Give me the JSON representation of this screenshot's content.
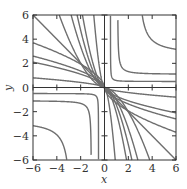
{
  "chart_data": {
    "type": "line",
    "title": "",
    "xlabel": "x",
    "ylabel": "y",
    "xlim": [
      -6,
      6
    ],
    "ylim": [
      -6,
      6
    ],
    "xticks": [
      -6,
      -4,
      -2,
      0,
      2,
      4,
      6
    ],
    "yticks": [
      -6,
      -4,
      -2,
      0,
      2,
      4,
      6
    ],
    "xtick_labels": [
      "−6",
      "−4",
      "−2",
      "0",
      "2",
      "4",
      "6"
    ],
    "ytick_labels": [
      "−6",
      "−4",
      "−2",
      "0",
      "2",
      "4",
      "6"
    ],
    "grid": false,
    "legend": null,
    "axes_through_origin": true,
    "series": [
      {
        "name": "hyperbolic r=0.5 (Q1 & Q3)",
        "kind": "hyperbolic",
        "r": 0.5,
        "points_q1": [
          [
            0.55,
            6
          ],
          [
            0.6,
            0.9
          ],
          [
            1,
            0.58
          ],
          [
            6,
            0.5
          ]
        ]
      },
      {
        "name": "hyperbolic r=1.1 (Q1 & Q3)",
        "kind": "hyperbolic",
        "r": 1.1,
        "points_q1": [
          [
            1.12,
            6
          ],
          [
            1.5,
            1.6
          ],
          [
            3,
            1.18
          ],
          [
            6,
            1.12
          ]
        ]
      },
      {
        "name": "hyperbolic r=2.8 (Q1 & Q3)",
        "kind": "hyperbolic",
        "r": 2.8,
        "points_q1": [
          [
            2.9,
            6
          ],
          [
            4,
            3.9
          ],
          [
            6,
            3.2
          ]
        ]
      },
      {
        "name": "line y=-x",
        "kind": "origin",
        "edge_x": -6,
        "edge_y": 6
      },
      {
        "name": "origin curve 1",
        "kind": "origin",
        "top_crossing_x": -3.8,
        "mirror_left_crossing_y": 3.7
      },
      {
        "name": "origin curve 2",
        "kind": "origin",
        "top_crossing_x": -2.8,
        "mirror_left_crossing_y": 2.6
      },
      {
        "name": "origin curve 3",
        "kind": "origin",
        "top_crossing_x": -2.3,
        "mirror_left_crossing_y": 2.1
      },
      {
        "name": "origin curve 4",
        "kind": "origin",
        "top_crossing_x": -1.85
      },
      {
        "name": "origin curve 5",
        "kind": "origin",
        "top_crossing_x": -0.9,
        "mirror_left_crossing_y": 0.8
      }
    ],
    "model": {
      "hyperbolic_r": [
        0.5,
        1.1,
        2.8
      ],
      "origin_steep_x0": [
        3.8,
        2.8,
        2.3,
        1.85,
        0.9
      ],
      "origin_shallow_y0": [
        3.7,
        2.6,
        2.1,
        0.8
      ],
      "origin_power": 1.7
    },
    "colors": {
      "curve": "#6e6e6e",
      "axes": "#333333",
      "background": "#ffffff"
    }
  },
  "plot": {
    "x_label": "x",
    "y_label": "y"
  }
}
